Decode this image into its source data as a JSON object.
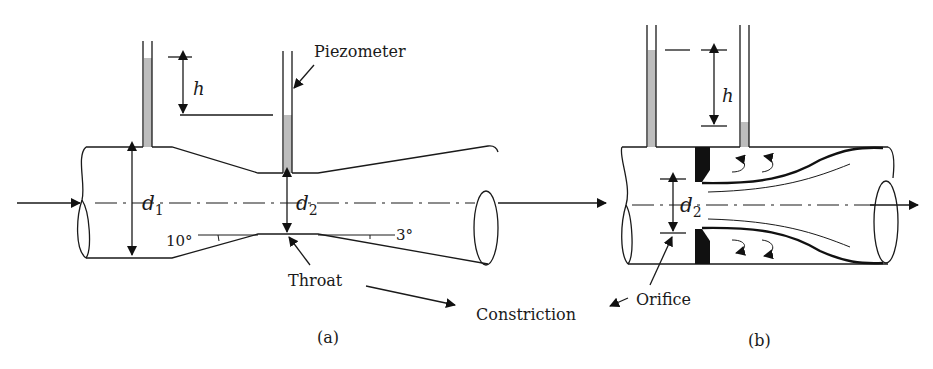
{
  "figure": {
    "panel_a": {
      "caption": "(a)",
      "labels": {
        "piezometer": "Piezometer",
        "head": "h",
        "d1": "d",
        "d1_sub": "1",
        "d2": "d",
        "d2_sub": "2",
        "converge_angle": "10°",
        "diverge_angle": "3°",
        "throat": "Throat"
      }
    },
    "panel_b": {
      "caption": "(b)",
      "labels": {
        "head": "h",
        "d2": "d",
        "d2_sub": "2",
        "orifice": "Orifice"
      }
    },
    "shared": {
      "constriction": "Constriction"
    },
    "colors": {
      "ink": "#1a1a1a",
      "fluid_stipple": "#bdbdbd",
      "background": "#ffffff"
    }
  }
}
